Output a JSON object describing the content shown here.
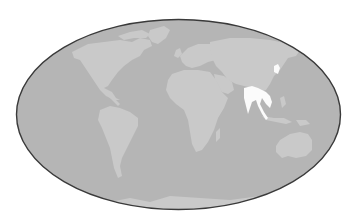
{
  "map": {
    "type": "world-map",
    "projection": "elliptical (Mollweide-like)",
    "colors": {
      "background": "#ffffff",
      "ocean": "#b5b5b5",
      "land": "#c9c9c9",
      "highlight": "#fbfbfb",
      "border": "#3a3a3a"
    },
    "highlighted_regions": [
      "South Asia / Southeast Asia (India, Myanmar, Thailand, Malay Peninsula)",
      "Korea / Japan"
    ],
    "continents": [
      "North America",
      "South America",
      "Europe",
      "Africa",
      "Asia",
      "Australia",
      "Antarctica",
      "Greenland"
    ]
  }
}
